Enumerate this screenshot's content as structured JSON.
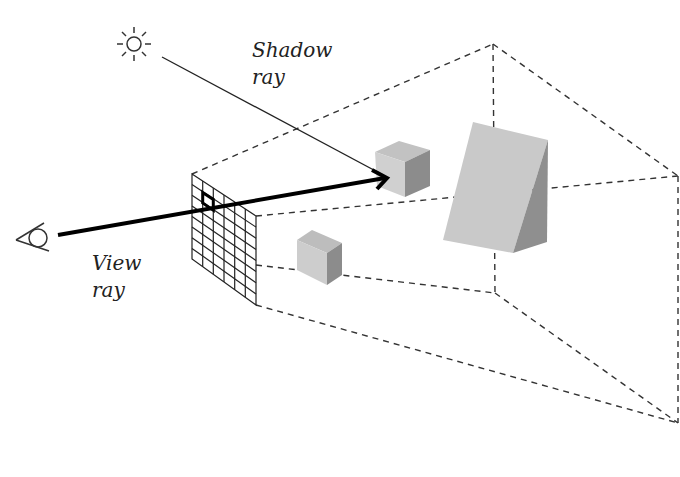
{
  "diagram": {
    "labels": {
      "shadow_ray_line1": "Shadow",
      "shadow_ray_line2": "ray",
      "view_ray_line1": "View",
      "view_ray_line2": "ray"
    },
    "icons": {
      "light_source": "sun-icon",
      "viewer": "eye-icon"
    },
    "objects": [
      "image-plane-grid",
      "cube-near",
      "cube-far",
      "wedge"
    ],
    "colors": {
      "line": "#222222",
      "face_light": "#cfcfcf",
      "face_mid": "#bdbdbd",
      "face_dark": "#8c8c8c"
    }
  }
}
